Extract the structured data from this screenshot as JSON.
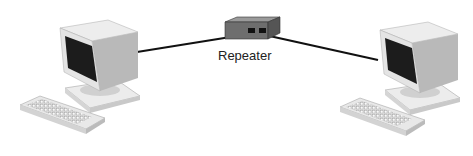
{
  "diagram": {
    "type": "network",
    "nodes": [
      {
        "id": "computer-left",
        "kind": "computer"
      },
      {
        "id": "repeater",
        "kind": "repeater",
        "label": "Repeater"
      },
      {
        "id": "computer-right",
        "kind": "computer"
      }
    ],
    "edges": [
      {
        "from": "computer-left",
        "to": "repeater"
      },
      {
        "from": "repeater",
        "to": "computer-right"
      }
    ]
  },
  "labels": {
    "repeater": "Repeater"
  }
}
